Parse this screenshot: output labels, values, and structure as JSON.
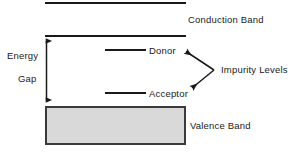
{
  "diagram": {
    "background_color": "#ffffff",
    "line_color": "#1a1a1a",
    "valence_fill_color": "#d9d9d9",
    "valence_border_color": "#3a3a3a",
    "labels": {
      "conduction_band": "Conduction Band",
      "valence_band": "Valence Band",
      "impurity_levels": "Impurity Levels",
      "donor": "Donor",
      "acceptor": "Acceptor",
      "energy": "Energy",
      "gap": "Gap"
    },
    "elements": {
      "top_band_edge_line": {
        "x1": 45,
        "y1": 3,
        "x2": 186,
        "y2": 3
      },
      "conduction_band_line": {
        "x1": 45,
        "y1": 36,
        "x2": 186,
        "y2": 36
      },
      "donor_level_line": {
        "x1": 105,
        "y1": 50,
        "x2": 146,
        "y2": 50
      },
      "acceptor_level_line": {
        "x1": 105,
        "y1": 93,
        "x2": 146,
        "y2": 93
      },
      "energy_gap_arrow": {
        "x": 46,
        "y_top": 37,
        "y_bottom": 104
      },
      "valence_band_box": {
        "x": 45,
        "y": 106,
        "width": 141,
        "height": 39
      },
      "impurity_pointer_vertex": {
        "x": 214,
        "y": 70
      },
      "impurity_pointer_upper_tip": {
        "x": 183,
        "y": 50
      },
      "impurity_pointer_lower_tip": {
        "x": 190,
        "y": 89
      }
    }
  }
}
